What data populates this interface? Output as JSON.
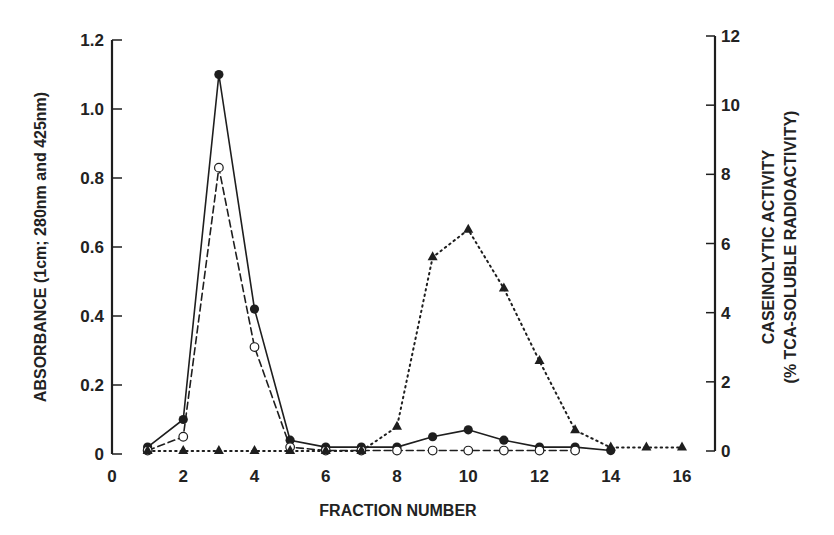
{
  "chart_data": {
    "type": "line",
    "title": "",
    "xlabel": "FRACTION NUMBER",
    "ylabel": "ABSORBANCE (1cm; 280nm and 425nm)",
    "y2label_line1": "CASEINOLYTIC ACTIVITY",
    "y2label_line2": "(% TCA-SOLUBLE RADIOACTIVITY)",
    "xlim": [
      0,
      16
    ],
    "ylim": [
      0,
      1.2
    ],
    "y2lim": [
      0,
      12
    ],
    "x_ticks": [
      0,
      2,
      4,
      6,
      8,
      10,
      12,
      14,
      16
    ],
    "y_ticks": [
      "0",
      "0.2",
      "0.4",
      "0.6",
      "0.8",
      "1.0",
      "1.2"
    ],
    "y_tick_values": [
      0,
      0.2,
      0.4,
      0.6,
      0.8,
      1.0,
      1.2
    ],
    "y2_ticks": [
      0,
      2,
      4,
      6,
      8,
      10,
      12
    ],
    "grid": false,
    "legend": "none",
    "series": [
      {
        "name": "Absorbance 280nm",
        "axis": "left",
        "marker": "filled-circle",
        "line": "solid",
        "x": [
          1,
          2,
          3,
          4,
          5,
          6,
          7,
          8,
          9,
          10,
          11,
          12,
          13,
          14
        ],
        "values": [
          0.02,
          0.1,
          1.1,
          0.42,
          0.04,
          0.02,
          0.02,
          0.02,
          0.05,
          0.07,
          0.04,
          0.02,
          0.02,
          0.01
        ]
      },
      {
        "name": "Absorbance 425nm",
        "axis": "left",
        "marker": "open-circle",
        "line": "dashed",
        "x": [
          1,
          2,
          3,
          4,
          5,
          6,
          7,
          8,
          9,
          10,
          11,
          12,
          13
        ],
        "values": [
          0.01,
          0.05,
          0.83,
          0.31,
          0.02,
          0.01,
          0.01,
          0.01,
          0.01,
          0.01,
          0.01,
          0.01,
          0.01
        ]
      },
      {
        "name": "Caseinolytic activity",
        "axis": "right",
        "marker": "filled-triangle",
        "line": "dotted",
        "x": [
          1,
          2,
          3,
          4,
          5,
          6,
          7,
          8,
          9,
          10,
          11,
          12,
          13,
          14,
          15,
          16
        ],
        "values": [
          0,
          0,
          0,
          0,
          0,
          0,
          0,
          0.7,
          5.6,
          6.4,
          4.7,
          2.6,
          0.6,
          0.1,
          0.1,
          0.1
        ]
      }
    ]
  }
}
